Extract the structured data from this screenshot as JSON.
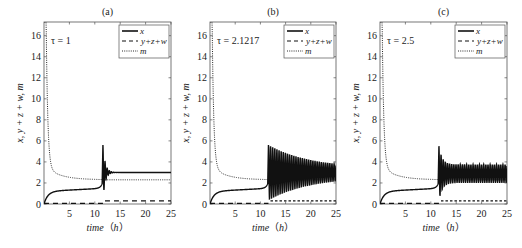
{
  "chart_data": [
    {
      "type": "line",
      "panel_label": "(a)",
      "annotation": "τ = 1",
      "xlabel": "time（h）",
      "ylabel": "x, y + z + w, m",
      "xlim": [
        0,
        25
      ],
      "ylim": [
        0,
        17.3
      ],
      "xticks": [
        5,
        10,
        15,
        20,
        25
      ],
      "yticks": [
        0,
        2,
        4,
        6,
        8,
        10,
        12,
        14,
        16
      ],
      "legend": [
        "x",
        "y+z+w",
        "m"
      ],
      "legend_position": "upper right",
      "series": [
        {
          "name": "x",
          "style": "solid",
          "x": [
            0,
            0.5,
            1,
            2,
            3,
            5,
            8,
            10,
            11,
            11.5,
            11.7,
            12,
            12.5,
            13,
            14,
            25
          ],
          "y": [
            0,
            0.5,
            0.8,
            1.05,
            1.15,
            1.2,
            1.3,
            1.4,
            1.6,
            2.5,
            5.4,
            2.6,
            3.8,
            3.0,
            3.0,
            3.0
          ]
        },
        {
          "name": "y+z+w",
          "style": "dashed",
          "x": [
            0,
            11.5,
            12,
            25
          ],
          "y": [
            0.02,
            0.02,
            0.3,
            0.3
          ]
        },
        {
          "name": "m",
          "style": "dotted",
          "x": [
            0,
            0.3,
            0.6,
            1,
            1.5,
            2,
            3,
            5,
            8,
            10,
            11.5,
            12,
            25
          ],
          "y": [
            17.3,
            16.5,
            10,
            6.2,
            4.5,
            3.7,
            3.2,
            2.9,
            2.6,
            2.45,
            2.3,
            2.3,
            2.3
          ]
        }
      ]
    },
    {
      "type": "line",
      "panel_label": "(b)",
      "annotation": "τ = 2.1217",
      "xlabel": "time（h）",
      "ylabel": "x, y + z + w, m",
      "xlim": [
        0,
        25
      ],
      "ylim": [
        0,
        17.3
      ],
      "xticks": [
        5,
        10,
        15,
        20,
        25
      ],
      "yticks": [
        0,
        2,
        4,
        6,
        8,
        10,
        12,
        14,
        16
      ],
      "legend": [
        "x",
        "y+z+w",
        "m"
      ],
      "legend_position": "upper right",
      "series": [
        {
          "name": "x",
          "style": "solid",
          "note": "slowly damped oscillation after t≈11.7, amplitude decaying from ~5.6 peak toward ~3.0 ± 0.4 at t=25",
          "x": [
            0,
            1,
            3,
            5,
            8,
            10,
            11,
            11.7,
            12,
            13,
            15,
            20,
            25
          ],
          "y": [
            0,
            0.8,
            1.15,
            1.2,
            1.3,
            1.4,
            1.6,
            5.6,
            2.3,
            4.3,
            3.8,
            3.3,
            3.0
          ]
        },
        {
          "name": "y+z+w",
          "style": "dashed",
          "x": [
            0,
            11.5,
            12,
            25
          ],
          "y": [
            0.02,
            0.02,
            0.3,
            0.3
          ]
        },
        {
          "name": "m",
          "style": "dotted",
          "x": [
            0,
            0.3,
            0.6,
            1,
            1.5,
            2,
            3,
            5,
            8,
            10,
            11.5,
            12,
            25
          ],
          "y": [
            17.3,
            16.5,
            10,
            6.2,
            4.5,
            3.7,
            3.2,
            2.9,
            2.6,
            2.45,
            2.3,
            2.3,
            2.3
          ]
        }
      ]
    },
    {
      "type": "line",
      "panel_label": "(c)",
      "annotation": "τ = 2.5",
      "xlabel": "time（h）",
      "ylabel": "x, y + z + w, m",
      "xlim": [
        0,
        25
      ],
      "ylim": [
        0,
        17.3
      ],
      "xticks": [
        5,
        10,
        15,
        20,
        25
      ],
      "yticks": [
        0,
        2,
        4,
        6,
        8,
        10,
        12,
        14,
        16
      ],
      "legend": [
        "x",
        "y+z+w",
        "m"
      ],
      "legend_position": "upper right",
      "series": [
        {
          "name": "x",
          "style": "solid",
          "note": "sustained oscillation after t≈11.7, peak ~5.6 then steady between ~2.0 and ~3.8",
          "x": [
            0,
            1,
            3,
            5,
            8,
            10,
            11,
            11.7,
            12,
            13,
            15,
            20,
            25
          ],
          "y": [
            0,
            0.8,
            1.15,
            1.2,
            1.3,
            1.4,
            1.6,
            5.6,
            2.0,
            4.5,
            3.8,
            3.7,
            3.7
          ]
        },
        {
          "name": "y+z+w",
          "style": "dashed",
          "x": [
            0,
            11.5,
            12,
            25
          ],
          "y": [
            0.02,
            0.02,
            0.3,
            0.3
          ]
        },
        {
          "name": "m",
          "style": "dotted",
          "x": [
            0,
            0.3,
            0.6,
            1,
            1.5,
            2,
            3,
            5,
            8,
            10,
            11.5,
            12,
            25
          ],
          "y": [
            17.3,
            16.5,
            10,
            6.2,
            4.5,
            3.7,
            3.2,
            2.9,
            2.6,
            2.45,
            2.3,
            2.3,
            2.3
          ]
        }
      ]
    }
  ],
  "panels": [
    {
      "label": "(a)",
      "tau": "τ = 1"
    },
    {
      "label": "(b)",
      "tau": "τ = 2.1217"
    },
    {
      "label": "(c)",
      "tau": "τ = 2.5"
    }
  ],
  "axes": {
    "xlabel_main": "time",
    "xlabel_unit": "（h）",
    "ylabel": "x, y + z + w, m",
    "xtick_labels": [
      "5",
      "10",
      "15",
      "20",
      "25"
    ],
    "ytick_labels": [
      "0",
      "2",
      "4",
      "6",
      "8",
      "10",
      "12",
      "14",
      "16"
    ]
  },
  "legend": {
    "x": "x",
    "yzw": "y+z+w",
    "m": "m"
  },
  "colors": {
    "line": "#111111",
    "axis": "#555555",
    "background": "#ffffff"
  }
}
